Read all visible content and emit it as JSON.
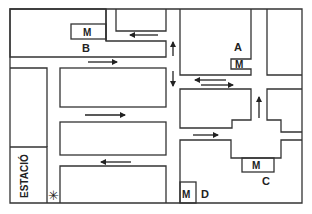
{
  "map": {
    "title": "Street map",
    "labels": {
      "A": "A",
      "B": "B",
      "C": "C",
      "D": "D",
      "station": "ESTACIÓ"
    },
    "metro_symbol": "M",
    "metro_stations": [
      {
        "id": "A",
        "label": "M"
      },
      {
        "id": "B",
        "label": "M"
      },
      {
        "id": "C",
        "label": "M"
      },
      {
        "id": "D",
        "label": "M"
      }
    ],
    "start_marker": "✳",
    "colors": {
      "line": "#333333",
      "background": "#ffffff"
    }
  }
}
